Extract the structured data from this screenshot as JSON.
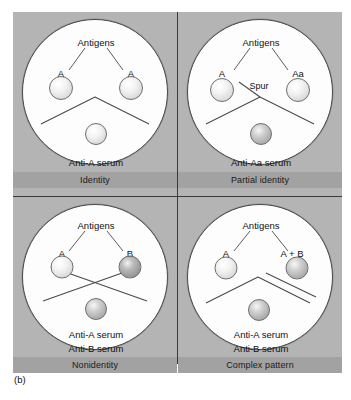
{
  "figure": {
    "caption": "(b)",
    "colors": {
      "plate_background": "#b4b4b4",
      "label_bar": "#a2a2a2",
      "dish_fill": "#fdfdfd",
      "line": "#4a4a4a",
      "text": "#111111"
    },
    "panels": [
      {
        "id": "identity",
        "label": "Identity",
        "antigens_label": "Antigens",
        "serum_label": "Anti-A serum",
        "well_labels": {
          "left": "A",
          "right": "A"
        },
        "well_shades": {
          "left": "light",
          "right": "light",
          "bottom": "light"
        },
        "precipitin": "single continuous chevron",
        "spur_label": ""
      },
      {
        "id": "partial-identity",
        "label": "Partial identity",
        "antigens_label": "Antigens",
        "serum_label": "Anti-Aa serum",
        "well_labels": {
          "left": "A",
          "right": "Aa"
        },
        "well_shades": {
          "left": "light",
          "right": "light",
          "bottom": "mid"
        },
        "precipitin": "chevron with spur",
        "spur_label": "Spur"
      },
      {
        "id": "nonidentity",
        "label": "Nonidentity",
        "antigens_label": "Antigens",
        "serum_label": "Anti-A serum",
        "serum_label2": "Anti-B serum",
        "well_labels": {
          "left": "A",
          "right": "B"
        },
        "well_shades": {
          "left": "light",
          "right": "dark",
          "bottom": "mid"
        },
        "precipitin": "crossed lines",
        "spur_label": ""
      },
      {
        "id": "complex-pattern",
        "label": "Complex pattern",
        "antigens_label": "Antigens",
        "serum_label": "Anti-A serum",
        "serum_label2": "Anti-B serum",
        "well_labels": {
          "left": "A",
          "right": "A + B"
        },
        "well_shades": {
          "left": "light",
          "right": "mid",
          "bottom": "mid"
        },
        "precipitin": "chevron plus second right-hand line",
        "spur_label": ""
      }
    ]
  }
}
